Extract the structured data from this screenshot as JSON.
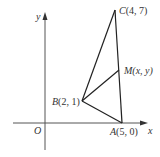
{
  "figure": {
    "axes": {
      "x_label": "x",
      "y_label": "y",
      "origin_label": "O",
      "axis_color": "#555555"
    },
    "points": {
      "A": {
        "name": "A",
        "coords": "(5, 0)",
        "label": "A(5, 0)"
      },
      "B": {
        "name": "B",
        "coords": "(2, 1)",
        "label": "B(2, 1)"
      },
      "C": {
        "name": "C",
        "coords": "(4, 7)",
        "label": "C(4, 7)"
      },
      "M": {
        "name": "M",
        "coords": "(x, y)",
        "label": "M(x, y)"
      }
    },
    "segments": [
      "AB",
      "BC",
      "CA",
      "BM"
    ],
    "line_color": "#222222"
  }
}
